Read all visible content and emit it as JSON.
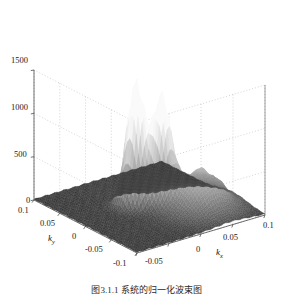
{
  "figure": {
    "kind": "matlab-3d-surface-plot",
    "background_color": "#ffffff",
    "axis_line_color": "#4d4d4d",
    "grid_color": "#b8b8b8",
    "surface_low_color": "#3a3a3a",
    "surface_high_color": "#f7f7f7",
    "caption": "图3.1.1  系统的归一化波束图"
  },
  "axes": {
    "z": {
      "label": "",
      "ticks": [
        "0",
        "500",
        "1000",
        "1500"
      ],
      "values": [
        0,
        500,
        1000,
        1500
      ],
      "min": 0,
      "max": 1500
    },
    "y": {
      "label": "k",
      "label_sub": "y",
      "ticks": [
        "0.1",
        "0.05",
        "0",
        "-0.05",
        "-0.1"
      ],
      "values": [
        0.1,
        0.05,
        0,
        -0.05,
        -0.1
      ],
      "min": -0.1,
      "max": 0.1
    },
    "x": {
      "label": "k",
      "label_sub": "x",
      "ticks": [
        "-0.05",
        "0",
        "0.05",
        "0.1"
      ],
      "values": [
        -0.05,
        0,
        0.05,
        0.1
      ],
      "min": -0.1,
      "max": 0.1
    }
  },
  "chart_data": {
    "type": "surface",
    "title": "",
    "xlabel": "k_x",
    "ylabel": "k_y",
    "zlabel": "",
    "xlim": [
      -0.1,
      0.1
    ],
    "ylim": [
      -0.1,
      0.1
    ],
    "zlim": [
      0,
      1500
    ],
    "grid": true,
    "legend": "none",
    "colormap": "gray",
    "view": {
      "azimuth": -37.5,
      "elevation": 30
    },
    "zticks": [
      0,
      500,
      1000,
      1500
    ],
    "xticks": [
      -0.1,
      -0.05,
      0,
      0.05,
      0.1
    ],
    "yticks": [
      -0.1,
      -0.05,
      0,
      0.05,
      0.1
    ],
    "peaks": [
      {
        "name": "peak-1",
        "kx": -0.012,
        "ky": 0.012,
        "amplitude": 1400,
        "width": 0.011
      },
      {
        "name": "peak-2",
        "kx": 0.014,
        "ky": -0.006,
        "amplitude": 1180,
        "width": 0.011
      },
      {
        "name": "sidelobe-hump",
        "kx": 0.048,
        "ky": -0.04,
        "amplitude": 430,
        "width": 0.026
      }
    ],
    "floor_level": 20
  }
}
